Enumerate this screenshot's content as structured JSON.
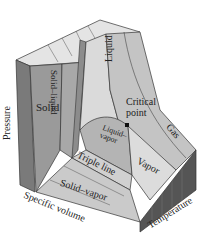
{
  "diagram": {
    "type": "P-v-T surface",
    "regions": {
      "solid": "Solid",
      "solid_liquid": "Solid–liquid",
      "liquid": "Liquid",
      "critical_point": "Critical point",
      "gas": "Gas",
      "liquid_vapor": "Liquid–vapor",
      "triple_line": "Triple line",
      "vapor": "Vapor",
      "solid_vapor": "Solid–vapor"
    },
    "axes": {
      "pressure": "Pressure",
      "specific_volume": "Specific volume",
      "temperature": "Temperature"
    },
    "colors": {
      "front_face": "#7a7a7a",
      "top_face": "#e4e4e4",
      "solid": "#9a9a9a",
      "liquid": "#d6d6d6",
      "gas": "#c4c4c4",
      "dome": "#b4b4b4",
      "vapor": "#dcdcdc",
      "solid_vapor": "#cacaca",
      "side_face": "#555555",
      "line": "#333333"
    }
  }
}
